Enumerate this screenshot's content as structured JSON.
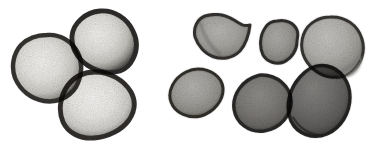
{
  "figure": {
    "title": "Grayscale micrograph of eight rounded grains",
    "background_color": "#ffffff",
    "width": 370,
    "height": 152,
    "has_text_labels": false,
    "has_scale_bar": false,
    "clusters": [
      {
        "name": "left-cluster",
        "grain_count": 3,
        "tone": "pale interior with dark rim"
      },
      {
        "name": "right-cluster",
        "grain_count": 5,
        "tone": "mid to dark gray"
      }
    ],
    "grains": [
      {
        "id": "grain-1",
        "cluster": "left-cluster",
        "position": "left",
        "cx": 47,
        "cy": 68,
        "rx": 34,
        "ry": 33,
        "rotation": -8,
        "interior_color": "#e8e7e4",
        "mid_color": "#cfcdc9",
        "rim_color": "#3c3a38",
        "rim_width": 4.5,
        "shape": "rounded-irregular"
      },
      {
        "id": "grain-2",
        "cluster": "left-cluster",
        "position": "top-center",
        "cx": 103,
        "cy": 41,
        "rx": 33,
        "ry": 31,
        "rotation": 12,
        "interior_color": "#e6e5e1",
        "mid_color": "#cbc9c5",
        "rim_color": "#343231",
        "rim_width": 5,
        "shape": "rounded-triangular-lobed"
      },
      {
        "id": "grain-3",
        "cluster": "left-cluster",
        "position": "bottom-center",
        "cx": 98,
        "cy": 105,
        "rx": 36,
        "ry": 33,
        "rotation": -5,
        "interior_color": "#eceae7",
        "mid_color": "#d2d0cc",
        "rim_color": "#383634",
        "rim_width": 5,
        "shape": "rounded-polygonal"
      },
      {
        "id": "grain-4",
        "cluster": "right-cluster",
        "position": "top-left",
        "cx": 222,
        "cy": 35,
        "rx": 28,
        "ry": 23,
        "rotation": -6,
        "interior_color": "#a8a6a3",
        "mid_color": "#97958f",
        "rim_color": "#3a3836",
        "rim_width": 3,
        "shape": "notched-fan"
      },
      {
        "id": "grain-5",
        "cluster": "right-cluster",
        "position": "top-middle-small",
        "cx": 280,
        "cy": 42,
        "rx": 20,
        "ry": 21,
        "rotation": 10,
        "interior_color": "#9e9c98",
        "mid_color": "#8d8b86",
        "rim_color": "#363432",
        "rim_width": 3,
        "shape": "rounded-notched"
      },
      {
        "id": "grain-6",
        "cluster": "right-cluster",
        "position": "top-right",
        "cx": 331,
        "cy": 47,
        "rx": 31,
        "ry": 30,
        "rotation": 8,
        "interior_color": "#b4b2ae",
        "mid_color": "#a09e99",
        "rim_color": "#3d3b39",
        "rim_width": 3,
        "shape": "round-with-flange"
      },
      {
        "id": "grain-7",
        "cluster": "right-cluster",
        "position": "bottom-left",
        "cx": 196,
        "cy": 93,
        "rx": 27,
        "ry": 24,
        "rotation": -12,
        "interior_color": "#a5a3a0",
        "mid_color": "#94928d",
        "rim_color": "#373533",
        "rim_width": 3,
        "shape": "oval"
      },
      {
        "id": "grain-8",
        "cluster": "right-cluster",
        "position": "bottom-center",
        "cx": 262,
        "cy": 104,
        "rx": 29,
        "ry": 29,
        "rotation": 4,
        "interior_color": "#7c7a77",
        "mid_color": "#6b6965",
        "rim_color": "#2f2d2c",
        "rim_width": 3.5,
        "shape": "round"
      },
      {
        "id": "grain-9",
        "cluster": "right-cluster",
        "position": "bottom-right",
        "cx": 318,
        "cy": 101,
        "rx": 31,
        "ry": 36,
        "rotation": -32,
        "interior_color": "#6e6c69",
        "mid_color": "#5d5b58",
        "rim_color": "#2a2827",
        "rim_width": 3.5,
        "shape": "tilted-oval"
      }
    ]
  }
}
